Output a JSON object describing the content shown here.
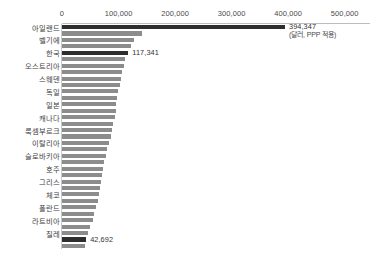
{
  "chart_data": {
    "type": "bar",
    "orientation": "horizontal",
    "title": "",
    "xlabel": "",
    "ylabel": "",
    "unit_note": "(달러, PPP 적용)",
    "xlim": [
      0,
      500000
    ],
    "grid": false,
    "legend": false,
    "axis_ticks": [
      "0",
      "100,000",
      "200,000",
      "300,000",
      "400,000",
      "500,000"
    ],
    "axis_tick_values": [
      0,
      100000,
      200000,
      300000,
      400000,
      500000
    ],
    "highlight_color": "#2e2e2e",
    "bar_color": "#8c8c8c",
    "categories": [
      "아일랜드",
      "",
      "벨기에",
      "",
      "한국",
      "",
      "오스트리아",
      "",
      "스웨덴",
      "",
      "독일",
      "",
      "일본",
      "",
      "캐나다",
      "",
      "룩셈부르크",
      "",
      "이탈리아",
      "",
      "슬로바키아",
      "",
      "호주",
      "",
      "그리스",
      "",
      "체코",
      "",
      "폴란드",
      "",
      "라트비아",
      "",
      "칠레",
      "",
      ""
    ],
    "values": [
      394347,
      141000,
      128000,
      122000,
      117341,
      112000,
      109000,
      106000,
      104000,
      102000,
      99000,
      97000,
      96000,
      95000,
      93000,
      90000,
      88000,
      86000,
      83000,
      80000,
      78000,
      75000,
      73000,
      71000,
      69000,
      67000,
      65000,
      63000,
      60000,
      57000,
      54000,
      50000,
      46000,
      42692,
      40000
    ],
    "labeled_values": [
      {
        "index": 0,
        "label": "394,347"
      },
      {
        "index": 4,
        "label": "117,341"
      },
      {
        "index": 33,
        "label": "42,692"
      }
    ],
    "highlight_indices": [
      0,
      4,
      33
    ]
  }
}
